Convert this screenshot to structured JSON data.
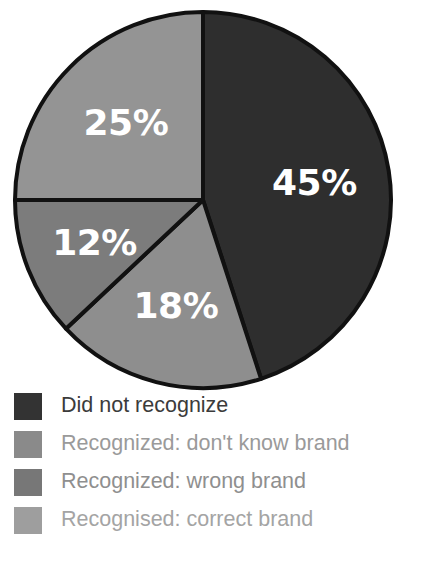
{
  "chart_data": {
    "type": "pie",
    "title": "",
    "subtitle": "",
    "xlabel": "",
    "ylabel": "",
    "units": "percent",
    "start_angle_deg": 0,
    "direction": "clockwise",
    "legend_position": "bottom-left",
    "grid": false,
    "categories": [
      "Did not recognize",
      "Recognized: don't know brand",
      "Recognized: wrong brand",
      "Recognised: correct brand"
    ],
    "values": [
      45,
      18,
      12,
      25
    ],
    "value_labels": [
      "45%",
      "18%",
      "12%",
      "25%"
    ],
    "colors": [
      "#2e2e2e",
      "#8e8e8e",
      "#7c7c7c",
      "#949494"
    ],
    "slices": [
      {
        "label": "Did not recognize",
        "value": 45,
        "value_label": "45%",
        "color": "#2e2e2e",
        "label_color": "#ffffff"
      },
      {
        "label": "Recognized: don't know brand",
        "value": 18,
        "value_label": "18%",
        "color": "#8e8e8e",
        "label_color": "#ffffff"
      },
      {
        "label": "Recognized: wrong brand",
        "value": 12,
        "value_label": "12%",
        "color": "#7c7c7c",
        "label_color": "#ffffff"
      },
      {
        "label": "Recognised: correct brand",
        "value": 25,
        "value_label": "25%",
        "color": "#949494",
        "label_color": "#ffffff"
      }
    ]
  },
  "pie": {
    "center_x": 203,
    "center_y": 200,
    "radius": 188,
    "outline_color": "#111111",
    "label_font_size": 36
  },
  "legend": {
    "items": [
      {
        "label": "Did not recognize",
        "swatch_color": "#333333",
        "text_color": "#3b3b3b"
      },
      {
        "label": "Recognized: don't know brand",
        "swatch_color": "#8a8a8a",
        "text_color": "#9a9a9a"
      },
      {
        "label": "Recognized: wrong brand",
        "swatch_color": "#777777",
        "text_color": "#8f8f8f"
      },
      {
        "label": "Recognised: correct brand",
        "swatch_color": "#9e9e9e",
        "text_color": "#a4a4a4"
      }
    ]
  }
}
